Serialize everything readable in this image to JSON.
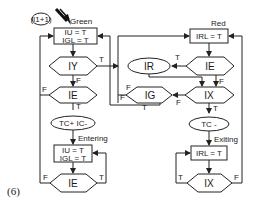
{
  "figure": {
    "caption": "(6)",
    "entry_marker": "(I1+1)",
    "states": {
      "green": "Green",
      "red": "Red",
      "entering": "Entering",
      "exiting": "Exiting"
    },
    "nodes": {
      "green_box_line1": "IU = T",
      "green_box_line2": "IGL = T",
      "iy": "IY",
      "ie_left": "IE",
      "tc_ic": "TC+  IC-",
      "entering_box_line1": "IU = T",
      "entering_box_line2": "IGL = T",
      "ie_bottom": "IE",
      "red_box": "IRL = T",
      "ie_right": "IE",
      "ir": "IR",
      "ix": "IX",
      "ig": "IG",
      "tc_minus": "TC -",
      "exiting_box": "IRL = T",
      "ix_bottom": "IX"
    },
    "edge_labels": {
      "iy_true": "T",
      "iy_false": "F",
      "ie_left_false": "F",
      "ie_left_true": "T",
      "ie_bottom_false": "F",
      "ie_bottom_true": "T",
      "ie_right_true": "T",
      "ie_right_false": "F",
      "ix_false": "F",
      "ix_true": "T",
      "ig_false": "F",
      "ig_true": "T",
      "ix_bottom_true": "T",
      "ix_bottom_false": "F",
      "red_left_false": "F"
    }
  }
}
